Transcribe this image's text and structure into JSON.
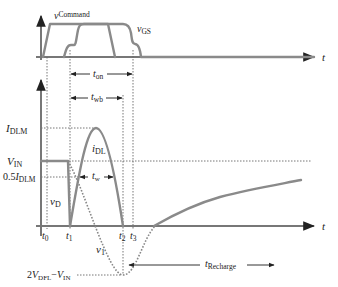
{
  "figure": {
    "top_panel": {
      "axis_label": "t",
      "signals": [
        {
          "name": "v",
          "subscript": "Command"
        },
        {
          "name": "v",
          "subscript": "GS"
        }
      ]
    },
    "bottom_panel": {
      "axis_label": "t",
      "y_levels": [
        {
          "id": "idlm",
          "main": "I",
          "sub": "DLM",
          "prefix": ""
        },
        {
          "id": "vin",
          "main": "V",
          "sub": "IN",
          "prefix": ""
        },
        {
          "id": "half_idlm",
          "main": "I",
          "sub": "DLM",
          "prefix": "0.5"
        },
        {
          "id": "min",
          "text_parts": [
            "2",
            "V",
            "DFL",
            "−",
            "V",
            "IN"
          ]
        }
      ],
      "curve_labels": {
        "idl": {
          "main": "i",
          "sub": "DL"
        },
        "vd": {
          "main": "v",
          "sub": "D"
        },
        "v1": {
          "main": "v",
          "sub": "1"
        }
      },
      "time_marks": [
        {
          "main": "t",
          "sub": "0"
        },
        {
          "main": "t",
          "sub": "1"
        },
        {
          "main": "t",
          "sub": "2"
        },
        {
          "main": "t",
          "sub": "3"
        }
      ],
      "intervals": [
        {
          "main": "t",
          "sub": "on"
        },
        {
          "main": "t",
          "sub": "wb"
        },
        {
          "main": "t",
          "sub": "w"
        },
        {
          "main": "t",
          "sub": "Recharge"
        }
      ]
    }
  }
}
